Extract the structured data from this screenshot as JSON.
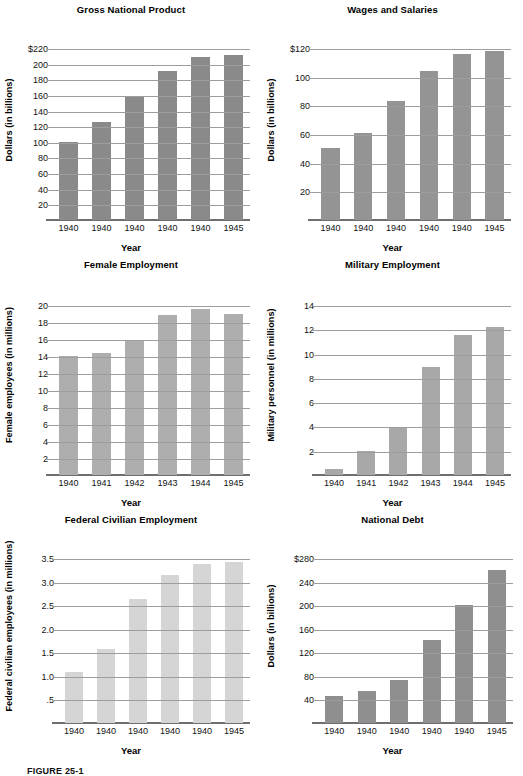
{
  "figure": {
    "caption": "FIGURE 25-1",
    "common_xlabel": "Year"
  },
  "chart_data": [
    {
      "id": "gross-national-product",
      "type": "bar",
      "title": "Gross National Product",
      "xlabel": "Year",
      "ylabel": "Dollars (in billions)",
      "categories": [
        "1940",
        "1940",
        "1940",
        "1940",
        "1940",
        "1945"
      ],
      "values": [
        100,
        126,
        157,
        191,
        209,
        211
      ],
      "yticks": [
        20,
        40,
        60,
        80,
        100,
        120,
        140,
        160,
        180,
        200,
        220
      ],
      "yticklabels": [
        "20",
        "40",
        "60",
        "80",
        "100",
        "120",
        "140",
        "160",
        "180",
        "200",
        "$220"
      ],
      "ylim": [
        0,
        220
      ],
      "grid": true,
      "bar_color": "#8a8a8a",
      "legend": "none"
    },
    {
      "id": "wages-and-salaries",
      "type": "bar",
      "title": "Wages and Salaries",
      "xlabel": "Year",
      "ylabel": "Dollars (in billions)",
      "categories": [
        "1940",
        "1940",
        "1940",
        "1940",
        "1940",
        "1945"
      ],
      "values": [
        50,
        61,
        83,
        104,
        116,
        118
      ],
      "yticks": [
        20,
        40,
        60,
        80,
        100,
        120
      ],
      "yticklabels": [
        "20",
        "40",
        "60",
        "80",
        "100",
        "$120"
      ],
      "ylim": [
        0,
        120
      ],
      "grid": true,
      "bar_color": "#949494",
      "legend": "none"
    },
    {
      "id": "female-employment",
      "type": "bar",
      "title": "Female Employment",
      "xlabel": "Year",
      "ylabel": "Female employees (in millions)",
      "categories": [
        "1940",
        "1941",
        "1942",
        "1943",
        "1944",
        "1945"
      ],
      "values": [
        14.0,
        14.4,
        15.9,
        18.8,
        19.5,
        19.0
      ],
      "yticks": [
        2,
        4,
        6,
        8,
        10,
        12,
        14,
        16,
        18,
        20
      ],
      "yticklabels": [
        "2",
        "4",
        "6",
        "8",
        "10",
        "12",
        "14",
        "16",
        "18",
        "20"
      ],
      "ylim": [
        0,
        20
      ],
      "grid": true,
      "bar_color": "#aeaeae",
      "legend": "none"
    },
    {
      "id": "military-employment",
      "type": "bar",
      "title": "Military Employment",
      "xlabel": "Year",
      "ylabel": "Military personnel (in millions)",
      "categories": [
        "1940",
        "1941",
        "1942",
        "1943",
        "1944",
        "1945"
      ],
      "values": [
        0.5,
        2.0,
        3.9,
        8.9,
        11.5,
        12.2
      ],
      "yticks": [
        2,
        4,
        6,
        8,
        10,
        12,
        14
      ],
      "yticklabels": [
        "2",
        "4",
        "6",
        "8",
        "10",
        "12",
        "14"
      ],
      "ylim": [
        0,
        14
      ],
      "grid": true,
      "bar_color": "#a8a8a8",
      "legend": "none"
    },
    {
      "id": "federal-civilian-employment",
      "type": "bar",
      "title": "Federal Civilian Employment",
      "xlabel": "Year",
      "ylabel": "Federal civilian employees (in millions)",
      "categories": [
        "1940",
        "1940",
        "1940",
        "1940",
        "1940",
        "1945"
      ],
      "values": [
        1.09,
        1.57,
        2.63,
        3.13,
        3.37,
        3.42
      ],
      "yticks": [
        0.5,
        1.0,
        1.5,
        2.0,
        2.5,
        3.0,
        3.5
      ],
      "yticklabels": [
        ".5",
        "1.0",
        "1.5",
        "2.0",
        "2.5",
        "3.0",
        "3.5"
      ],
      "ylim": [
        0,
        3.5
      ],
      "grid": true,
      "bar_color": "#d5d5d5",
      "legend": "none"
    },
    {
      "id": "national-debt",
      "type": "bar",
      "title": "National Debt",
      "xlabel": "Year",
      "ylabel": "Dollars (in billions)",
      "categories": [
        "1940",
        "1940",
        "1940",
        "1940",
        "1940",
        "1945"
      ],
      "values": [
        45,
        54,
        73,
        141,
        201,
        260
      ],
      "yticks": [
        40,
        80,
        120,
        160,
        200,
        240,
        280
      ],
      "yticklabels": [
        "40",
        "80",
        "120",
        "160",
        "200",
        "240",
        "$280"
      ],
      "ylim": [
        0,
        280
      ],
      "grid": true,
      "bar_color": "#8f8f8f",
      "legend": "none"
    }
  ]
}
